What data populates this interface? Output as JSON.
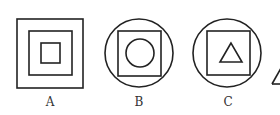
{
  "figures": [
    {
      "label": "A",
      "description": "three nested squares"
    },
    {
      "label": "B",
      "description": "circle containing square containing circle"
    },
    {
      "label": "C",
      "description": "circle containing square containing triangle"
    }
  ],
  "partial_figure": {
    "description": "partially visible triangle at right edge"
  },
  "stroke_color": "#222222"
}
